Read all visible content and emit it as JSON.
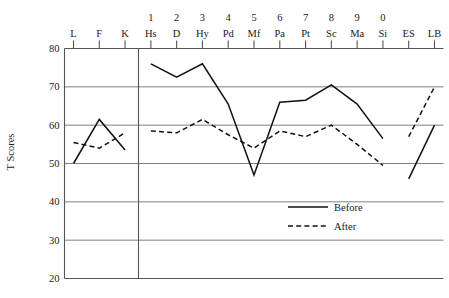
{
  "chart_data": {
    "type": "line",
    "title": "",
    "xlabel": "",
    "ylabel": "T Scores",
    "ylim": [
      20,
      80
    ],
    "yticks": [
      80,
      70,
      60,
      50,
      40,
      30,
      20
    ],
    "grid": true,
    "legend_position": "inside-lower-right",
    "categories": [
      "L",
      "F",
      "K",
      "Hs",
      "D",
      "Hy",
      "Pd",
      "Mf",
      "Pa",
      "Pt",
      "Sc",
      "Ma",
      "Si",
      "ES",
      "LB"
    ],
    "category_numbers": [
      "",
      "",
      "",
      "1",
      "2",
      "3",
      "4",
      "5",
      "6",
      "7",
      "8",
      "9",
      "0",
      "",
      ""
    ],
    "series": [
      {
        "name": "Before",
        "style": "solid",
        "values": [
          50,
          61.5,
          53.5,
          76,
          72.5,
          76,
          65.5,
          47,
          66,
          66.5,
          70.5,
          65.5,
          56.5,
          46,
          60
        ],
        "segments": [
          [
            0,
            2
          ],
          [
            3,
            12
          ],
          [
            13,
            14
          ]
        ]
      },
      {
        "name": "After",
        "style": "dashed",
        "values": [
          55.5,
          54,
          58,
          58.5,
          58,
          61.5,
          57.5,
          54,
          58.5,
          57,
          60,
          55,
          49.5,
          57,
          70
        ],
        "segments": [
          [
            0,
            2
          ],
          [
            3,
            12
          ],
          [
            13,
            14
          ]
        ]
      }
    ],
    "legend": [
      {
        "label": "Before",
        "style": "solid"
      },
      {
        "label": "After",
        "style": "dashed"
      }
    ],
    "divider_after_category": "K"
  },
  "axis": {
    "y_title": "T Scores",
    "y_tick_labels": [
      "80",
      "70",
      "60",
      "50",
      "40",
      "30",
      "20"
    ]
  }
}
